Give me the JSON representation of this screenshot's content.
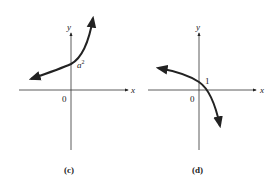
{
  "panels": [
    {
      "id": "c",
      "caption": "(c)",
      "x_axis_label": "x",
      "y_axis_label": "y",
      "origin_label": "0",
      "intercept_label_base": "a",
      "intercept_label_exp": "2",
      "curve": "increasing exponential, y-intercept a^2"
    },
    {
      "id": "d",
      "caption": "(d)",
      "x_axis_label": "x",
      "y_axis_label": "y",
      "origin_label": "0",
      "intercept_label": "1",
      "curve": "decreasing concave-down curve, y-intercept 1"
    }
  ],
  "colors": {
    "ink": "#222222",
    "background": "#ffffff"
  }
}
